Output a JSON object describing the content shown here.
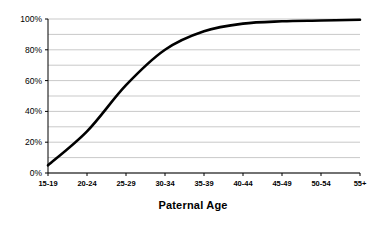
{
  "chart_data": {
    "type": "line",
    "title": "",
    "subtitle": "",
    "xlabel": "Paternal Age",
    "ylabel": "",
    "categories": [
      "15-19",
      "20-24",
      "25-29",
      "30-34",
      "35-39",
      "40-44",
      "45-49",
      "50-54",
      "55+"
    ],
    "series": [
      {
        "name": "Cumulative percent",
        "values": [
          5,
          27,
          57,
          80,
          92,
          97,
          98.5,
          99,
          99.5
        ]
      }
    ],
    "ylim": [
      0,
      100
    ],
    "ytick_labels": [
      "0%",
      "20%",
      "40%",
      "60%",
      "80%",
      "100%"
    ],
    "ytick_values": [
      0,
      20,
      40,
      60,
      80,
      100
    ],
    "minor_gridline_step": 10,
    "grid": true,
    "legend": false,
    "legend_position": "none",
    "line_color": "#000000",
    "grid_color": "#c9c9c9",
    "axis_color": "#000000",
    "background_color": "#ffffff"
  },
  "axis_title": {
    "text": "Paternal Age"
  }
}
